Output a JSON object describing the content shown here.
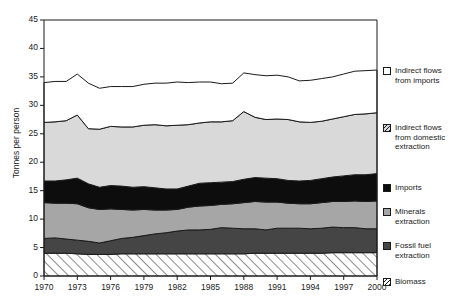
{
  "chart_data": {
    "type": "area",
    "title": "",
    "xlabel": "",
    "ylabel": "Tonnes per person",
    "xlim": [
      1970,
      2000
    ],
    "ylim": [
      0,
      45
    ],
    "grid": false,
    "legend_position": "right",
    "ytick_labels": [
      "0",
      "5",
      "10",
      "15",
      "20",
      "25",
      "30",
      "35",
      "40",
      "45"
    ],
    "ytick_values": [
      0,
      5,
      10,
      15,
      20,
      25,
      30,
      35,
      40,
      45
    ],
    "xtick_labels": [
      "1970",
      "1973",
      "1976",
      "1979",
      "1982",
      "1985",
      "1988",
      "1991",
      "1994",
      "1997",
      "2000"
    ],
    "xtick_values": [
      1970,
      1973,
      1976,
      1979,
      1982,
      1985,
      1988,
      1991,
      1994,
      1997,
      2000
    ],
    "x": [
      1970,
      1971,
      1972,
      1973,
      1974,
      1975,
      1976,
      1977,
      1978,
      1979,
      1980,
      1981,
      1982,
      1983,
      1984,
      1985,
      1986,
      1987,
      1988,
      1989,
      1990,
      1991,
      1992,
      1993,
      1994,
      1995,
      1996,
      1997,
      1998,
      1999,
      2000
    ],
    "stack_order": [
      "Biomass",
      "Fossil fuel extraction",
      "Minerals extraction",
      "Imports",
      "Indirect flows from domestic extraction",
      "Indirect flows from imports"
    ],
    "series": [
      {
        "name": "Biomass",
        "fill": "hatch",
        "values": [
          4.0,
          4.0,
          4.0,
          3.9,
          3.8,
          3.8,
          3.8,
          3.9,
          3.9,
          3.9,
          3.9,
          3.9,
          3.9,
          3.9,
          3.9,
          3.9,
          3.9,
          3.9,
          3.9,
          4.0,
          4.0,
          4.0,
          4.0,
          4.0,
          4.0,
          4.0,
          4.1,
          4.1,
          4.1,
          4.1,
          4.1
        ]
      },
      {
        "name": "Fossil fuel extraction",
        "fill": "#454545",
        "values": [
          2.6,
          2.7,
          2.5,
          2.4,
          2.3,
          2.0,
          2.4,
          2.7,
          2.9,
          3.2,
          3.5,
          3.7,
          4.0,
          4.2,
          4.2,
          4.3,
          4.6,
          4.5,
          4.4,
          4.3,
          4.1,
          4.4,
          4.4,
          4.4,
          4.3,
          4.4,
          4.5,
          4.4,
          4.4,
          4.2,
          4.2
        ]
      },
      {
        "name": "Minerals extraction",
        "fill": "#a6a6a6",
        "values": [
          6.3,
          6.1,
          6.3,
          6.4,
          5.9,
          5.9,
          5.6,
          5.1,
          4.8,
          4.6,
          4.2,
          4.0,
          3.8,
          4.0,
          4.2,
          4.2,
          4.1,
          4.3,
          4.6,
          4.8,
          4.9,
          4.6,
          4.4,
          4.3,
          4.4,
          4.5,
          4.5,
          4.6,
          4.7,
          4.8,
          4.9
        ]
      },
      {
        "name": "Imports",
        "fill": "#0d0d0d",
        "values": [
          3.8,
          3.9,
          4.1,
          4.5,
          4.2,
          3.9,
          4.1,
          4.1,
          4.0,
          4.0,
          3.9,
          3.7,
          3.6,
          3.7,
          4.0,
          4.0,
          3.9,
          3.9,
          4.1,
          4.2,
          4.2,
          4.1,
          4.0,
          4.0,
          4.1,
          4.2,
          4.3,
          4.5,
          4.6,
          4.7,
          4.8
        ]
      },
      {
        "name": "Indirect flows from domestic extraction",
        "fill": "#d9d9d9",
        "values": [
          10.3,
          10.4,
          10.4,
          11.1,
          9.7,
          10.2,
          10.4,
          10.4,
          10.6,
          10.8,
          11.1,
          11.1,
          11.2,
          10.8,
          10.6,
          10.7,
          10.6,
          10.7,
          11.9,
          10.6,
          10.3,
          10.5,
          10.7,
          10.4,
          10.2,
          10.1,
          10.2,
          10.4,
          10.6,
          10.7,
          10.7
        ]
      },
      {
        "name": "Indirect flows from imports",
        "fill": "#ffffff",
        "values": [
          7.0,
          7.1,
          6.9,
          7.2,
          8.0,
          7.2,
          7.0,
          7.1,
          7.1,
          7.2,
          7.3,
          7.5,
          7.6,
          7.4,
          7.2,
          7.0,
          6.7,
          6.6,
          6.8,
          7.5,
          7.7,
          7.7,
          7.5,
          7.2,
          7.4,
          7.5,
          7.4,
          7.5,
          7.6,
          7.6,
          7.5
        ]
      }
    ],
    "cumulative_top": [
      34.0,
      34.2,
      34.2,
      35.5,
      33.9,
      33.0,
      33.3,
      33.3,
      33.3,
      33.7,
      33.9,
      33.9,
      34.1,
      34.0,
      34.1,
      34.1,
      33.8,
      33.9,
      35.7,
      35.4,
      35.2,
      35.3,
      35.0,
      34.3,
      34.4,
      34.7,
      35.0,
      35.5,
      36.0,
      36.1,
      36.2
    ]
  },
  "legend": {
    "items": [
      {
        "key": "indirect-imports",
        "label_lines": [
          "Indirect flows",
          "from imports"
        ],
        "swatch": "sw-indirect-imports",
        "top": 0
      },
      {
        "key": "indirect-domestic",
        "label_lines": [
          "Indirect flows",
          "from domestic",
          "extraction"
        ],
        "swatch": "sw-indirect-domestic",
        "top": 57
      },
      {
        "key": "imports",
        "label_lines": [
          "Imports"
        ],
        "swatch": "sw-imports",
        "top": 117
      },
      {
        "key": "minerals",
        "label_lines": [
          "Minerals",
          "extraction"
        ],
        "swatch": "sw-minerals",
        "top": 141
      },
      {
        "key": "fossil-fuel",
        "label_lines": [
          "Fossil fuel",
          "extraction"
        ],
        "swatch": "sw-fossil",
        "top": 175
      },
      {
        "key": "biomass",
        "label_lines": [
          "Biomass"
        ],
        "swatch": "sw-biomass",
        "top": 211
      }
    ]
  }
}
